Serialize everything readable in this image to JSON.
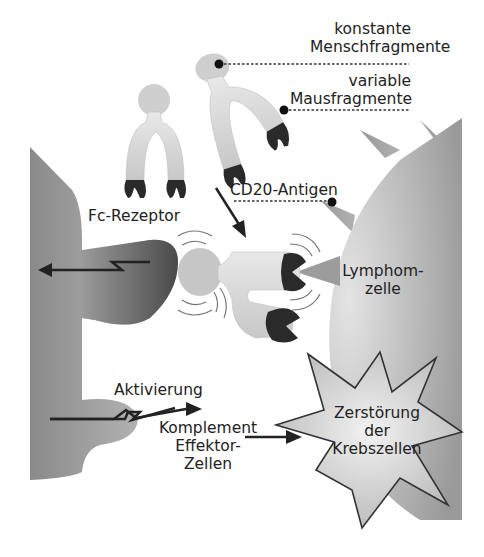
{
  "labels": {
    "constant_1": "konstante",
    "constant_2": "Menschfragmente",
    "variable_1": "variable",
    "variable_2": "Mausfragmente",
    "cd20": "CD20-Antigen",
    "fc_receptor": "Fc-Rezeptor",
    "lymphoma_1": "Lymphom-",
    "lymphoma_2": "zelle",
    "activation": "Aktivierung",
    "complement_1": "Komplement",
    "complement_2": "Effektor-",
    "complement_3": "Zellen",
    "destruction_1": "Zerstörung",
    "destruction_2": "der",
    "destruction_3": "Krebszellen"
  },
  "colors": {
    "antibody_light": "#e6e6e6",
    "antibody_mid": "#c4c4c4",
    "variable_region": "#2a2a2a",
    "effector_cell": "#8c8c8c",
    "receptor_dark": "#4a4a4a",
    "lymphoma_cell": "#b8b8b8",
    "star_fill": "#d8d8d8",
    "line": "#222222"
  }
}
